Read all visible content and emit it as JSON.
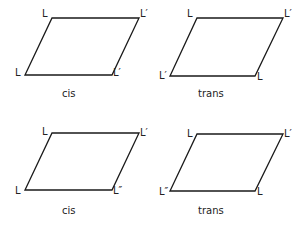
{
  "diagrams": [
    {
      "caption": "cis",
      "vertices": {
        "top_left": "L",
        "top_right": "L′",
        "bottom_right": "L′",
        "bottom_left": "L"
      }
    },
    {
      "caption": "trans",
      "vertices": {
        "top_left": "L",
        "top_right": "L′",
        "bottom_right": "L",
        "bottom_left": "L′"
      }
    },
    {
      "caption": "cis",
      "vertices": {
        "top_left": "L",
        "top_right": "L′",
        "bottom_right": "L″",
        "bottom_left": "L"
      }
    },
    {
      "caption": "trans",
      "vertices": {
        "top_left": "L",
        "top_right": "L′",
        "bottom_right": "L",
        "bottom_left": "L″"
      }
    }
  ]
}
